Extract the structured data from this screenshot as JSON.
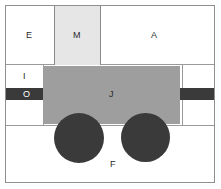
{
  "diagram": {
    "canvas": {
      "width": 221,
      "height": 189,
      "background": "#ffffff"
    },
    "frame": {
      "border_color": "#8f8f8f",
      "fill": "#ffffff"
    },
    "palette": {
      "outline": "#8f8f8f",
      "rule": "#9a9a9a",
      "light_block": "#e6e6e6",
      "mid_block": "#9e9e9e",
      "dark_block": "#3a3a3a",
      "label_dark": "#2b2b2b",
      "label_light": "#ffffff"
    },
    "regions": [
      {
        "key": "e",
        "label": "E",
        "fill": "#ffffff",
        "shape": "rect",
        "note": "upper-left open cell"
      },
      {
        "key": "m",
        "label": "M",
        "fill": "#e6e6e6",
        "shape": "rect",
        "note": "upper-middle light block"
      },
      {
        "key": "a",
        "label": "A",
        "fill": "#ffffff",
        "shape": "rect",
        "note": "upper-right open cell"
      },
      {
        "key": "i",
        "label": "I",
        "fill": "#ffffff",
        "shape": "rect",
        "note": "left mid open cell above band"
      },
      {
        "key": "o",
        "label": "O",
        "fill": "#3a3a3a",
        "shape": "band",
        "note": "dark horizontal band"
      },
      {
        "key": "j",
        "label": "J",
        "fill": "#9e9e9e",
        "shape": "rect",
        "note": "central mid-gray body"
      },
      {
        "key": "f",
        "label": "F",
        "fill": "#3a3a3a",
        "shape": "circle",
        "note": "wheel pair"
      }
    ],
    "labels": {
      "e": "E",
      "m": "M",
      "a": "A",
      "i": "I",
      "o": "O",
      "j": "J",
      "f": "F"
    }
  }
}
